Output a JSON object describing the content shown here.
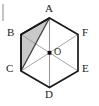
{
  "figure": {
    "shape_name": "regular-hexagon",
    "background_color": "#ffffff",
    "outline_color": "#1a1a1a",
    "diagonal_color": "#8f8f8f",
    "highlight_edge_color": "#3a3a3a",
    "shaded_region_fill": "#c9c9c9",
    "shaded_region_label": "triangle-ABC",
    "center_dot_color": "#111111",
    "labels": {
      "A": "A",
      "B": "B",
      "C": "C",
      "D": "D",
      "E": "E",
      "F": "F",
      "O": "O"
    },
    "vertices": [
      {
        "id": "A",
        "label": "A",
        "x": 49.5,
        "y": 18.0,
        "label_x": 45.0,
        "label_y": 4.0
      },
      {
        "id": "B",
        "label": "B",
        "x": 21.0,
        "y": 34.5,
        "label_x": 8.0,
        "label_y": 28.0
      },
      {
        "id": "C",
        "label": "C",
        "x": 21.0,
        "y": 71.0,
        "label_x": 7.0,
        "label_y": 64.0
      },
      {
        "id": "D",
        "label": "D",
        "x": 49.5,
        "y": 87.5,
        "label_x": 45.0,
        "label_y": 90.0
      },
      {
        "id": "E",
        "label": "E",
        "x": 78.0,
        "y": 71.0,
        "label_x": 81.0,
        "label_y": 64.0
      },
      {
        "id": "F",
        "label": "F",
        "x": 78.0,
        "y": 34.5,
        "label_x": 81.0,
        "label_y": 28.0
      }
    ],
    "center": {
      "id": "O",
      "label": "O",
      "x": 49.5,
      "y": 52.8,
      "label_x": 55.0,
      "label_y": 48.0
    },
    "diagonals": [
      {
        "name": "diagonal-AD",
        "from": "A",
        "to": "D"
      },
      {
        "name": "diagonal-BE",
        "from": "B",
        "to": "E"
      },
      {
        "name": "diagonal-CF",
        "from": "C",
        "to": "F"
      }
    ],
    "highlight_segments": [
      {
        "name": "segment-AC",
        "from": "A",
        "to": "C"
      }
    ],
    "shaded_polygon": [
      "A",
      "B",
      "C"
    ],
    "edge_tick": {
      "name": "left-margin-tick",
      "visible": true
    }
  }
}
